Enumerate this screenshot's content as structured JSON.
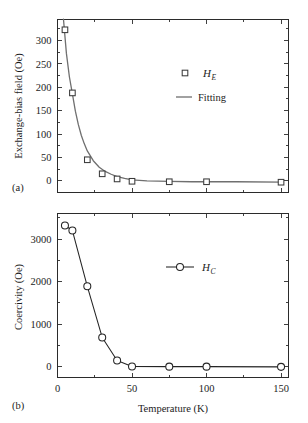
{
  "figure": {
    "panel_a_label": "(a)",
    "panel_b_label": "(b)",
    "x_axis_title": "Temperature (K)",
    "panel_a_y_title": "Exchange-bias field (Oe)",
    "panel_b_y_title": "Coercivity (Oe)",
    "line_color": "#242424",
    "fit_color": "#6f6f6f",
    "marker_face_color": "#ffffff",
    "frame_color": "#2b2b2b",
    "background_color": "#ffffff"
  },
  "legend_a": {
    "marker_symbol": "square-open",
    "marker_label_base": "H",
    "marker_label_sub": "E",
    "fit_symbol": "line",
    "fit_label": "Fitting"
  },
  "legend_b": {
    "marker_symbol": "circle-open-with-line",
    "marker_label_base": "H",
    "marker_label_sub": "C"
  },
  "ticks": {
    "x_labels": [
      "0",
      "50",
      "100",
      "150"
    ],
    "x_values": [
      0,
      50,
      100,
      150
    ],
    "panel_a_y_labels": [
      "0",
      "50",
      "100",
      "150",
      "200",
      "250",
      "300"
    ],
    "panel_a_y_values": [
      0,
      50,
      100,
      150,
      200,
      250,
      300
    ],
    "panel_b_y_labels": [
      "0",
      "1000",
      "2000",
      "3000"
    ],
    "panel_b_y_values": [
      0,
      1000,
      2000,
      3000
    ]
  },
  "chart_data": [
    {
      "type": "scatter",
      "panel": "(a)",
      "title": "",
      "xlabel": "Temperature (K)",
      "ylabel": "Exchange-bias field (Oe)",
      "xlim": [
        0,
        155
      ],
      "ylim": [
        -25,
        345
      ],
      "grid": false,
      "legend_position": "upper-center",
      "xticks": [
        0,
        50,
        100,
        150
      ],
      "yticks": [
        0,
        50,
        100,
        150,
        200,
        250,
        300
      ],
      "x": [
        5,
        10,
        20,
        30,
        40,
        50,
        75,
        100,
        150
      ],
      "series": [
        {
          "name": "H_E",
          "marker": "square-open",
          "values": [
            323,
            188,
            45,
            15,
            4,
            -1,
            -2,
            -2,
            -3
          ]
        },
        {
          "name": "Fitting",
          "marker": "line",
          "model": "exponential-decay",
          "x": [
            4,
            6,
            8,
            10,
            12,
            14,
            16,
            18,
            20,
            24,
            28,
            32,
            36,
            40,
            45,
            50,
            60,
            75,
            90,
            100,
            120,
            150
          ],
          "values": [
            346,
            272,
            222,
            186,
            149,
            120,
            97,
            79,
            64,
            43,
            29,
            20,
            14,
            9,
            5,
            2,
            0,
            -1,
            -2,
            -2,
            -2,
            -3
          ]
        }
      ]
    },
    {
      "type": "line",
      "panel": "(b)",
      "title": "",
      "xlabel": "Temperature (K)",
      "ylabel": "Coercivity (Oe)",
      "xlim": [
        0,
        155
      ],
      "ylim": [
        -250,
        3600
      ],
      "grid": false,
      "legend_position": "upper-center",
      "xticks": [
        0,
        50,
        100,
        150
      ],
      "yticks": [
        0,
        1000,
        2000,
        3000
      ],
      "x": [
        5,
        10,
        20,
        30,
        40,
        50,
        75,
        100,
        150
      ],
      "series": [
        {
          "name": "H_C",
          "marker": "circle-open",
          "values": [
            3320,
            3200,
            1890,
            690,
            150,
            10,
            5,
            5,
            0
          ]
        }
      ]
    }
  ]
}
